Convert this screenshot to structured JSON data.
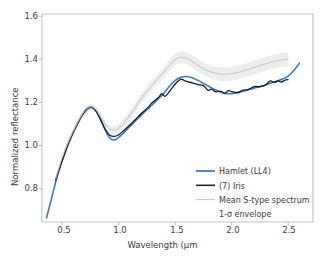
{
  "chart_data": {
    "type": "line",
    "title": "",
    "xlabel": "Wavelength (µm",
    "ylabel": "Normalized reflectance",
    "xlim": [
      0.32,
      2.72
    ],
    "ylim": [
      0.645,
      1.61
    ],
    "xticks": [
      "0.5",
      "1.0",
      "1.5",
      "2.0",
      "2.5"
    ],
    "xtick_values": [
      0.5,
      1.0,
      1.5,
      2.0,
      2.5
    ],
    "yticks": [
      "0.8",
      "1.0",
      "1.2",
      "1.4",
      "1.6"
    ],
    "ytick_values": [
      0.8,
      1.0,
      1.2,
      1.4,
      1.6
    ],
    "grid": false,
    "legend_position": "lower right",
    "legend_frame": false,
    "series": [
      {
        "name": "Hamlet (LL4)",
        "color": "#3a7cb8",
        "linewidth": 1.6,
        "style": "solid",
        "x": [
          0.36,
          0.4,
          0.44,
          0.48,
          0.52,
          0.56,
          0.6,
          0.64,
          0.68,
          0.72,
          0.76,
          0.8,
          0.84,
          0.88,
          0.92,
          0.96,
          1.0,
          1.05,
          1.1,
          1.15,
          1.2,
          1.25,
          1.3,
          1.35,
          1.4,
          1.45,
          1.5,
          1.55,
          1.6,
          1.65,
          1.7,
          1.75,
          1.8,
          1.85,
          1.9,
          1.95,
          2.0,
          2.05,
          2.1,
          2.15,
          2.2,
          2.25,
          2.3,
          2.35,
          2.4,
          2.45,
          2.5,
          2.55,
          2.6
        ],
        "y": [
          0.665,
          0.745,
          0.828,
          0.9,
          0.96,
          1.015,
          1.063,
          1.105,
          1.142,
          1.168,
          1.176,
          1.16,
          1.12,
          1.072,
          1.035,
          1.026,
          1.038,
          1.062,
          1.09,
          1.115,
          1.141,
          1.166,
          1.19,
          1.216,
          1.243,
          1.276,
          1.302,
          1.316,
          1.32,
          1.314,
          1.302,
          1.288,
          1.274,
          1.26,
          1.248,
          1.241,
          1.24,
          1.245,
          1.252,
          1.259,
          1.266,
          1.273,
          1.281,
          1.29,
          1.299,
          1.308,
          1.322,
          1.348,
          1.382
        ]
      },
      {
        "name": "(7) Iris",
        "color": "#16192b",
        "linewidth": 1.3,
        "style": "solid",
        "x": [
          0.44,
          0.48,
          0.52,
          0.56,
          0.6,
          0.64,
          0.68,
          0.72,
          0.76,
          0.8,
          0.84,
          0.88,
          0.92,
          0.96,
          1.0,
          1.05,
          1.1,
          1.15,
          1.2,
          1.25,
          1.3,
          1.35,
          1.38,
          1.41,
          1.45,
          1.5,
          1.55,
          1.6,
          1.65,
          1.7,
          1.75,
          1.79,
          1.82,
          1.86,
          1.9,
          1.94,
          1.97,
          2.0,
          2.05,
          2.1,
          2.15,
          2.2,
          2.25,
          2.3,
          2.34,
          2.38,
          2.41,
          2.44,
          2.47,
          2.5
        ],
        "y": [
          0.84,
          0.902,
          0.962,
          1.018,
          1.066,
          1.108,
          1.145,
          1.172,
          1.178,
          1.158,
          1.118,
          1.075,
          1.048,
          1.042,
          1.05,
          1.072,
          1.096,
          1.122,
          1.148,
          1.172,
          1.196,
          1.221,
          1.238,
          1.229,
          1.257,
          1.288,
          1.307,
          1.305,
          1.296,
          1.284,
          1.27,
          1.252,
          1.265,
          1.25,
          1.257,
          1.24,
          1.247,
          1.243,
          1.246,
          1.252,
          1.259,
          1.266,
          1.274,
          1.285,
          1.296,
          1.288,
          1.303,
          1.294,
          1.308,
          1.312
        ]
      },
      {
        "name": "Mean S-type spectrum",
        "color": "#c2c2c2",
        "linewidth": 1.0,
        "style": "solid",
        "x": [
          0.44,
          0.5,
          0.56,
          0.62,
          0.68,
          0.72,
          0.76,
          0.8,
          0.84,
          0.88,
          0.92,
          0.96,
          1.0,
          1.05,
          1.1,
          1.15,
          1.2,
          1.25,
          1.3,
          1.35,
          1.4,
          1.45,
          1.5,
          1.55,
          1.6,
          1.65,
          1.7,
          1.75,
          1.8,
          1.85,
          1.9,
          1.95,
          2.0,
          2.05,
          2.1,
          2.15,
          2.2,
          2.25,
          2.3,
          2.35,
          2.4,
          2.45,
          2.5
        ],
        "y": [
          0.845,
          0.945,
          1.025,
          1.092,
          1.148,
          1.172,
          1.18,
          1.165,
          1.132,
          1.098,
          1.076,
          1.07,
          1.08,
          1.108,
          1.142,
          1.18,
          1.218,
          1.252,
          1.283,
          1.312,
          1.34,
          1.372,
          1.398,
          1.409,
          1.404,
          1.39,
          1.372,
          1.356,
          1.344,
          1.336,
          1.331,
          1.33,
          1.333,
          1.338,
          1.345,
          1.353,
          1.362,
          1.371,
          1.379,
          1.387,
          1.393,
          1.397,
          1.4
        ]
      },
      {
        "name": "1-σ envelope",
        "color": "#d8d8d8",
        "style": "band",
        "note": "shaded 1-sigma envelope around mean S-type spectrum"
      }
    ]
  },
  "axes": {
    "xlabel": "Wavelength (µm",
    "ylabel": "Normalized reflectance",
    "xticks": [
      {
        "label": "0.5"
      },
      {
        "label": "1.0"
      },
      {
        "label": "1.5"
      },
      {
        "label": "2.0"
      },
      {
        "label": "2.5"
      }
    ],
    "yticks": [
      {
        "label": "0.8"
      },
      {
        "label": "1.0"
      },
      {
        "label": "1.2"
      },
      {
        "label": "1.4"
      },
      {
        "label": "1.6"
      }
    ]
  },
  "legend": {
    "items": [
      {
        "label": "Hamlet (LL4)",
        "color": "#3a7cb8",
        "swatch": true
      },
      {
        "label": "(7) Iris",
        "color": "#16192b",
        "swatch": true
      },
      {
        "label": "Mean S-type spectrum",
        "color": "#c2c2c2",
        "swatch": true
      },
      {
        "label": "1-σ envelope",
        "color": "#d8d8d8",
        "swatch": false
      }
    ]
  },
  "colors": {
    "hamlet": "#3a7cb8",
    "iris": "#16192b",
    "mean_stype": "#c2c2c2",
    "envelope": "#d8d8d8",
    "axis": "#b0b0b0",
    "text": "#3b3b3b",
    "background": "#ffffff"
  }
}
